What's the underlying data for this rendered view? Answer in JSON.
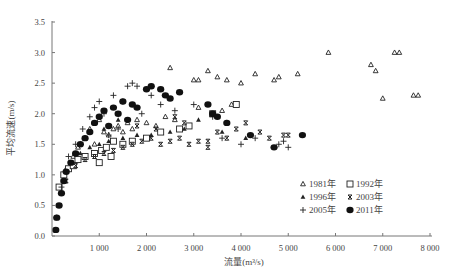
{
  "chart_data": {
    "type": "scatter",
    "title": "",
    "xlabel": "流量(m³/s)",
    "ylabel": "平均流速(m/s)",
    "xlim": [
      0,
      8000
    ],
    "ylim": [
      0,
      3.5
    ],
    "xticks": [
      "1 000",
      "2 000",
      "3 000",
      "4 000",
      "5 000",
      "6 000",
      "7 000",
      "8 000"
    ],
    "xtick_values": [
      1000,
      2000,
      3000,
      4000,
      5000,
      6000,
      7000,
      8000
    ],
    "yticks": [
      "0.0",
      "0.5",
      "1.0",
      "1.5",
      "2.0",
      "2.5",
      "3.0",
      "3.5"
    ],
    "ytick_values": [
      0,
      0.5,
      1.0,
      1.5,
      2.0,
      2.5,
      3.0,
      3.5
    ],
    "grid": false,
    "legend_position": "lower right",
    "series": [
      {
        "name": "1981年",
        "marker": "triangle-open",
        "points": [
          [
            300,
            1.1
          ],
          [
            450,
            1.3
          ],
          [
            550,
            1.45
          ],
          [
            700,
            1.6
          ],
          [
            800,
            1.75
          ],
          [
            900,
            1.5
          ],
          [
            1000,
            1.9
          ],
          [
            1100,
            1.7
          ],
          [
            1200,
            1.65
          ],
          [
            1300,
            1.75
          ],
          [
            1400,
            1.8
          ],
          [
            1500,
            1.7
          ],
          [
            1600,
            1.85
          ],
          [
            1700,
            1.75
          ],
          [
            1800,
            1.9
          ],
          [
            2000,
            1.85
          ],
          [
            2200,
            1.8
          ],
          [
            2500,
            2.75
          ],
          [
            2400,
            1.95
          ],
          [
            2600,
            1.9
          ],
          [
            3000,
            2.55
          ],
          [
            3100,
            2.55
          ],
          [
            3300,
            2.7
          ],
          [
            3500,
            2.6
          ],
          [
            3700,
            2.55
          ],
          [
            4000,
            2.5
          ],
          [
            4300,
            2.65
          ],
          [
            4700,
            2.55
          ],
          [
            4800,
            2.6
          ],
          [
            5200,
            2.65
          ],
          [
            5850,
            3.0
          ],
          [
            6750,
            2.8
          ],
          [
            6850,
            2.7
          ],
          [
            7000,
            2.25
          ],
          [
            7250,
            3.0
          ],
          [
            7350,
            3.0
          ],
          [
            7650,
            2.3
          ],
          [
            7750,
            2.3
          ],
          [
            3100,
            2.1
          ],
          [
            3600,
            2.05
          ],
          [
            3800,
            2.15
          ]
        ]
      },
      {
        "name": "1992年",
        "marker": "square-open",
        "points": [
          [
            150,
            0.8
          ],
          [
            250,
            1.0
          ],
          [
            350,
            1.1
          ],
          [
            450,
            1.15
          ],
          [
            550,
            1.25
          ],
          [
            700,
            1.3
          ],
          [
            900,
            1.35
          ],
          [
            1050,
            1.4
          ],
          [
            1150,
            1.45
          ],
          [
            1300,
            1.55
          ],
          [
            1500,
            1.5
          ],
          [
            1700,
            1.55
          ],
          [
            2000,
            1.6
          ],
          [
            2300,
            1.7
          ],
          [
            2700,
            1.75
          ],
          [
            2900,
            1.8
          ],
          [
            3400,
            2.0
          ],
          [
            3900,
            2.15
          ],
          [
            1000,
            1.2
          ],
          [
            1250,
            1.3
          ]
        ]
      },
      {
        "name": "1996年",
        "marker": "triangle-filled",
        "points": [
          [
            400,
            1.2
          ],
          [
            600,
            1.35
          ],
          [
            800,
            1.45
          ],
          [
            1000,
            1.5
          ],
          [
            1200,
            1.55
          ],
          [
            1500,
            1.6
          ],
          [
            1800,
            1.65
          ],
          [
            2100,
            1.65
          ],
          [
            2500,
            1.7
          ],
          [
            2800,
            1.75
          ],
          [
            3100,
            1.9
          ],
          [
            3600,
            1.7
          ],
          [
            4100,
            1.6
          ],
          [
            1100,
            1.75
          ],
          [
            1400,
            1.9
          ]
        ]
      },
      {
        "name": "2003年",
        "marker": "x",
        "points": [
          [
            300,
            0.9
          ],
          [
            500,
            1.15
          ],
          [
            700,
            1.25
          ],
          [
            900,
            1.3
          ],
          [
            1100,
            1.35
          ],
          [
            1300,
            1.4
          ],
          [
            1500,
            1.45
          ],
          [
            1700,
            1.5
          ],
          [
            1900,
            1.55
          ],
          [
            2100,
            1.6
          ],
          [
            2300,
            1.5
          ],
          [
            2500,
            1.55
          ],
          [
            2700,
            1.6
          ],
          [
            2900,
            1.5
          ],
          [
            3100,
            1.55
          ],
          [
            3300,
            1.55
          ],
          [
            3500,
            1.7
          ],
          [
            3700,
            1.6
          ],
          [
            3900,
            1.75
          ],
          [
            4100,
            1.85
          ],
          [
            4400,
            1.7
          ],
          [
            4600,
            1.6
          ],
          [
            4900,
            1.65
          ],
          [
            5000,
            1.65
          ],
          [
            2800,
            1.85
          ],
          [
            2600,
            1.95
          ],
          [
            3300,
            1.45
          ],
          [
            2200,
            1.75
          ],
          [
            1800,
            1.8
          ]
        ]
      },
      {
        "name": "2005年",
        "marker": "plus",
        "points": [
          [
            100,
            0.3
          ],
          [
            200,
            0.8
          ],
          [
            350,
            1.3
          ],
          [
            500,
            1.5
          ],
          [
            650,
            1.75
          ],
          [
            800,
            1.95
          ],
          [
            900,
            2.1
          ],
          [
            1000,
            2.2
          ],
          [
            1100,
            2.0
          ],
          [
            1300,
            2.3
          ],
          [
            1500,
            2.2
          ],
          [
            1600,
            2.45
          ],
          [
            1700,
            2.5
          ],
          [
            1800,
            2.45
          ],
          [
            1900,
            2.0
          ],
          [
            2100,
            2.3
          ],
          [
            2300,
            2.15
          ],
          [
            2600,
            2.05
          ],
          [
            3000,
            2.15
          ],
          [
            3400,
            1.95
          ],
          [
            3700,
            1.85
          ],
          [
            3600,
            1.6
          ],
          [
            4000,
            1.5
          ],
          [
            4300,
            1.6
          ],
          [
            4800,
            1.5
          ],
          [
            4900,
            1.55
          ],
          [
            5000,
            1.45
          ],
          [
            1200,
            1.65
          ],
          [
            1400,
            1.75
          ]
        ]
      },
      {
        "name": "2011年",
        "marker": "circle-filled",
        "points": [
          [
            80,
            0.1
          ],
          [
            100,
            0.3
          ],
          [
            150,
            0.5
          ],
          [
            200,
            0.7
          ],
          [
            250,
            0.9
          ],
          [
            300,
            1.05
          ],
          [
            400,
            1.2
          ],
          [
            500,
            1.35
          ],
          [
            600,
            1.5
          ],
          [
            700,
            1.6
          ],
          [
            800,
            1.7
          ],
          [
            900,
            1.85
          ],
          [
            1000,
            1.95
          ],
          [
            1100,
            2.05
          ],
          [
            1300,
            2.1
          ],
          [
            1400,
            2.0
          ],
          [
            1500,
            2.2
          ],
          [
            1700,
            2.15
          ],
          [
            1800,
            2.1
          ],
          [
            2000,
            2.4
          ],
          [
            2100,
            2.45
          ],
          [
            2300,
            2.4
          ],
          [
            2400,
            2.3
          ],
          [
            2500,
            2.25
          ],
          [
            2700,
            2.35
          ],
          [
            3300,
            2.15
          ],
          [
            3400,
            2.0
          ],
          [
            3500,
            1.95
          ],
          [
            3700,
            1.85
          ],
          [
            4200,
            1.65
          ],
          [
            4700,
            1.45
          ],
          [
            5300,
            1.65
          ],
          [
            1600,
            1.9
          ],
          [
            1200,
            1.8
          ]
        ]
      }
    ]
  },
  "legend": {
    "items": [
      {
        "label": "1981年",
        "marker": "triangle-open"
      },
      {
        "label": "1992年",
        "marker": "square-open"
      },
      {
        "label": "1996年",
        "marker": "triangle-filled"
      },
      {
        "label": "2003年",
        "marker": "x"
      },
      {
        "label": "2005年",
        "marker": "plus"
      },
      {
        "label": "2011年",
        "marker": "circle-filled"
      }
    ]
  },
  "colors": {
    "axis": "#666666",
    "marker": "#222222"
  }
}
